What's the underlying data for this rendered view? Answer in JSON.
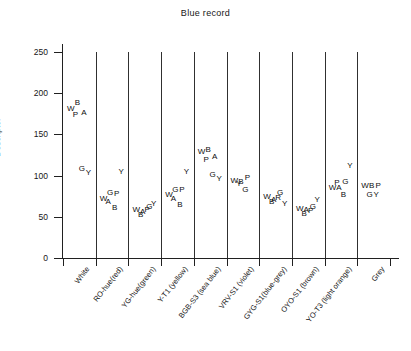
{
  "chart_data": {
    "type": "scatter",
    "title": "Blue record",
    "xlabel": "",
    "ylabel": "Descriptor",
    "ylim": [
      0,
      250
    ],
    "yticks": [
      0,
      50,
      100,
      150,
      200,
      250
    ],
    "ytick_labels": [
      "0",
      "50",
      "100",
      "150",
      "200",
      "250"
    ],
    "grid": false,
    "legend": "none",
    "marker_style": "letter-labels",
    "categories": [
      "White",
      "RO-hue(red)",
      "YG-hue(green)",
      "Y-T1 (yellow)",
      "BGB-S3 (sea blue)",
      "VRV-S1 (violet)",
      "GYG-S1(blue-grey)",
      "OYO-S1 (brown)",
      "YO-T3 (light orange)",
      "Grey"
    ],
    "series": [
      {
        "name": "White",
        "points": [
          {
            "label": "W",
            "value": 181
          },
          {
            "label": "B",
            "value": 188
          },
          {
            "label": "A",
            "value": 176
          },
          {
            "label": "P",
            "value": 173
          },
          {
            "label": "G",
            "value": 108
          },
          {
            "label": "Y",
            "value": 103
          }
        ]
      },
      {
        "name": "RO-hue(red)",
        "points": [
          {
            "label": "W",
            "value": 72
          },
          {
            "label": "G",
            "value": 79
          },
          {
            "label": "P",
            "value": 78
          },
          {
            "label": "A",
            "value": 68
          },
          {
            "label": "B",
            "value": 61
          },
          {
            "label": "Y",
            "value": 104
          }
        ]
      },
      {
        "name": "YG-hue(green)",
        "points": [
          {
            "label": "W",
            "value": 58
          },
          {
            "label": "A",
            "value": 56
          },
          {
            "label": "G",
            "value": 62
          },
          {
            "label": "B",
            "value": 52
          },
          {
            "label": "P",
            "value": 58
          },
          {
            "label": "Y",
            "value": 65
          }
        ]
      },
      {
        "name": "Y-T1 (yellow)",
        "points": [
          {
            "label": "W",
            "value": 76
          },
          {
            "label": "G",
            "value": 82
          },
          {
            "label": "P",
            "value": 82
          },
          {
            "label": "A",
            "value": 72
          },
          {
            "label": "B",
            "value": 64
          },
          {
            "label": "Y",
            "value": 104
          }
        ]
      },
      {
        "name": "BGB-S3 (sea blue)",
        "points": [
          {
            "label": "W",
            "value": 129
          },
          {
            "label": "B",
            "value": 131
          },
          {
            "label": "A",
            "value": 122
          },
          {
            "label": "P",
            "value": 119
          },
          {
            "label": "G",
            "value": 101
          },
          {
            "label": "Y",
            "value": 96
          }
        ]
      },
      {
        "name": "VRV-S1 (violet)",
        "points": [
          {
            "label": "W",
            "value": 94
          },
          {
            "label": "B",
            "value": 92
          },
          {
            "label": "P",
            "value": 97
          },
          {
            "label": "Y",
            "value": 90
          },
          {
            "label": "G",
            "value": 83
          }
        ]
      },
      {
        "name": "GYG-S1(blue-grey)",
        "points": [
          {
            "label": "W",
            "value": 74
          },
          {
            "label": "A",
            "value": 70
          },
          {
            "label": "G",
            "value": 79
          },
          {
            "label": "B",
            "value": 68
          },
          {
            "label": "R",
            "value": 73
          },
          {
            "label": "Y",
            "value": 66
          }
        ]
      },
      {
        "name": "OYO-S1 (brown)",
        "points": [
          {
            "label": "W",
            "value": 60
          },
          {
            "label": "A",
            "value": 58
          },
          {
            "label": "G",
            "value": 62
          },
          {
            "label": "B",
            "value": 53
          },
          {
            "label": "P",
            "value": 57
          },
          {
            "label": "Y",
            "value": 70
          }
        ]
      },
      {
        "name": "YO-T3 (light orange)",
        "points": [
          {
            "label": "W",
            "value": 85
          },
          {
            "label": "A",
            "value": 85
          },
          {
            "label": "G",
            "value": 92
          },
          {
            "label": "P",
            "value": 91
          },
          {
            "label": "B",
            "value": 76
          },
          {
            "label": "Y",
            "value": 112
          }
        ]
      },
      {
        "name": "Grey",
        "points": [
          {
            "label": "W",
            "value": 87
          },
          {
            "label": "B",
            "value": 87
          },
          {
            "label": "P",
            "value": 87
          },
          {
            "label": "G",
            "value": 76
          },
          {
            "label": "Y",
            "value": 76
          }
        ]
      }
    ]
  }
}
